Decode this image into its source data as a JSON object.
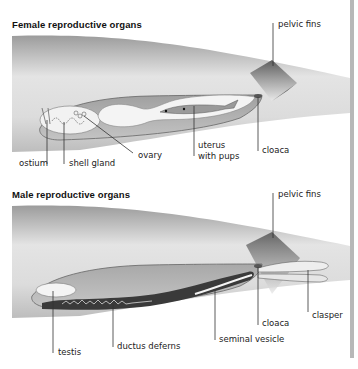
{
  "panels": [
    {
      "title": "Female reproductive organs",
      "labels": {
        "pelvic_fins": "pelvic fins",
        "ostium": "ostium",
        "shell_gland": "shell gland",
        "ovary": "ovary",
        "uterus_line1": "uterus",
        "uterus_line2": "with pups",
        "cloaca": "cloaca"
      }
    },
    {
      "title": "Male reproductive organs",
      "labels": {
        "pelvic_fins": "pelvic fins",
        "testis": "testis",
        "ductus_deferens": "ductus deferns",
        "seminal_vesicle": "seminal vesicle",
        "cloaca": "cloaca",
        "clasper": "clasper"
      }
    }
  ],
  "colors": {
    "body_gray": "#cfcfcf",
    "inner_gray": "#b3b3b3",
    "organ_white": "#f4f4f4",
    "duct_dark": "#3a3a3a",
    "leader_line": "#333333",
    "side_bar": "#b8b8b8"
  }
}
